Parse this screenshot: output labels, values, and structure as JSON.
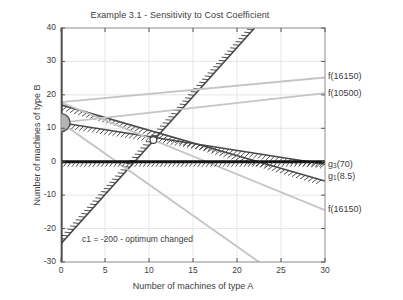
{
  "chart_data": {
    "type": "line",
    "title": "Example 3.1 - Sensitivity to Cost Coefficient",
    "xlabel": "Number of machines of type A",
    "ylabel": "Number of machines of type B",
    "xlim": [
      0,
      30
    ],
    "ylim": [
      -30,
      40
    ],
    "xticks": [
      0,
      5,
      10,
      15,
      20,
      25,
      30
    ],
    "yticks": [
      -30,
      -20,
      -10,
      0,
      10,
      20,
      30,
      40
    ],
    "xtick_labels": [
      "0",
      "5",
      "10",
      "15",
      "20",
      "25",
      "30"
    ],
    "ytick_labels": [
      "-30",
      "-20",
      "-10",
      "0",
      "10",
      "20",
      "30",
      "40"
    ],
    "grid": true,
    "grid_color": "#e3e3e3",
    "background": "#ffffff",
    "legend_position": "inline-right",
    "annotations": [
      {
        "name": "cost-coefficient-note",
        "text": "c1 = -200 - optimum changed",
        "x": 2.4,
        "y": -23.5
      }
    ],
    "series": [
      {
        "name": "g3(70)",
        "label": "g₃(70)",
        "label_base": "g",
        "label_sub": "3",
        "label_rest": "(70)",
        "kind": "constraint-hatched",
        "color": "#4a4a4a",
        "hatch_side": "below",
        "points": [
          [
            0,
            11.666
          ],
          [
            30,
            -0.75
          ]
        ],
        "label_xy": [
          30.3,
          -0.9
        ]
      },
      {
        "name": "g1(8.5)",
        "label": "g₁(8.5)",
        "label_base": "g",
        "label_sub": "1",
        "label_rest": "(8.5)",
        "kind": "constraint-hatched",
        "color": "#4a4a4a",
        "hatch_side": "below",
        "points": [
          [
            0,
            17.0
          ],
          [
            30,
            -5.8
          ]
        ],
        "label_xy": [
          30.3,
          -4.6
        ]
      },
      {
        "name": "g2-steep",
        "label": "",
        "kind": "constraint-hatched",
        "color": "#4a4a4a",
        "hatch_side": "left",
        "points": [
          [
            0,
            -24.5
          ],
          [
            22.0,
            40.0
          ]
        ],
        "label_xy": null
      },
      {
        "name": "f(16150)-upper",
        "label": "f(16150)",
        "kind": "objective",
        "color": "#c4c4c4",
        "points": [
          [
            0,
            17.8
          ],
          [
            30,
            25.2
          ]
        ],
        "label_xy": [
          30.3,
          25.2
        ]
      },
      {
        "name": "f(10500)",
        "label": "f(10500)",
        "kind": "objective",
        "color": "#c4c4c4",
        "points": [
          [
            0,
            11.7
          ],
          [
            30,
            20.5
          ]
        ],
        "label_xy": [
          30.3,
          20.4
        ]
      },
      {
        "name": "f(16150)-lower",
        "label": "f(16150)",
        "kind": "objective",
        "color": "#c4c4c4",
        "points": [
          [
            0,
            17.8
          ],
          [
            30,
            -14.5
          ]
        ],
        "label_xy": [
          30.3,
          -14.4
        ]
      },
      {
        "name": "f-steep-descending",
        "label": "",
        "kind": "objective",
        "color": "#c4c4c4",
        "points": [
          [
            0,
            11.7
          ],
          [
            22.5,
            -30.0
          ]
        ],
        "label_xy": null
      },
      {
        "name": "nonnegativity-B",
        "label": "",
        "kind": "axis-constraint",
        "color": "#111111",
        "points": [
          [
            0,
            0
          ],
          [
            30,
            0
          ]
        ],
        "label_xy": null
      },
      {
        "name": "nonnegativity-A",
        "label": "",
        "kind": "axis-constraint",
        "color": "#111111",
        "points": [
          [
            0,
            -30
          ],
          [
            0,
            40
          ]
        ],
        "label_xy": null
      }
    ],
    "markers": [
      {
        "name": "optimum-point",
        "x": 0,
        "y": 11.7,
        "radius_px": 9,
        "fill": "#b5b5b5",
        "edge": "#4a4a4a",
        "style": "filled-circle"
      },
      {
        "name": "previous-vertex-point",
        "x": 10.5,
        "y": 6.5,
        "radius_px": 3.4,
        "fill": "#ffffff",
        "edge": "#3a3a3a",
        "style": "open-circle"
      }
    ]
  }
}
